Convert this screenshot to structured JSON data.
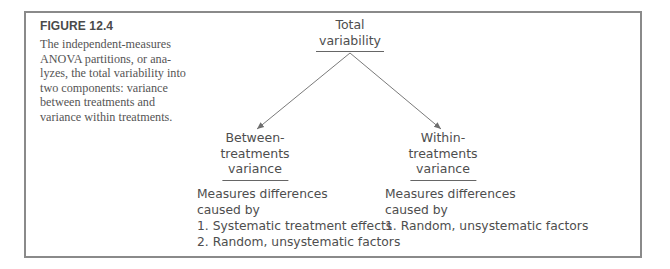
{
  "figure": {
    "label": "FIGURE 12.4",
    "caption_lines": [
      "The independent-measures",
      "ANOVA partitions, or ana-",
      "lyzes, the total variability into",
      "two components: variance",
      "between treatments and",
      "variance within treatments."
    ]
  },
  "diagram": {
    "root": {
      "lines": [
        "Total",
        "variability"
      ]
    },
    "left": {
      "lines": [
        "Between-",
        "treatments",
        "variance"
      ],
      "description": {
        "lines": [
          "Measures differences",
          "caused by"
        ],
        "items": [
          "1. Systematic treatment effects",
          "2. Random, unsystematic factors"
        ]
      }
    },
    "right": {
      "lines": [
        "Within-",
        "treatments",
        "variance"
      ],
      "description": {
        "lines": [
          "Measures differences",
          "caused by"
        ],
        "items": [
          "1. Random, unsystematic factors"
        ]
      }
    },
    "colors": {
      "text": "#4e4e4e",
      "lines": "#7a7a7a",
      "border": "#8a8a8a"
    }
  }
}
